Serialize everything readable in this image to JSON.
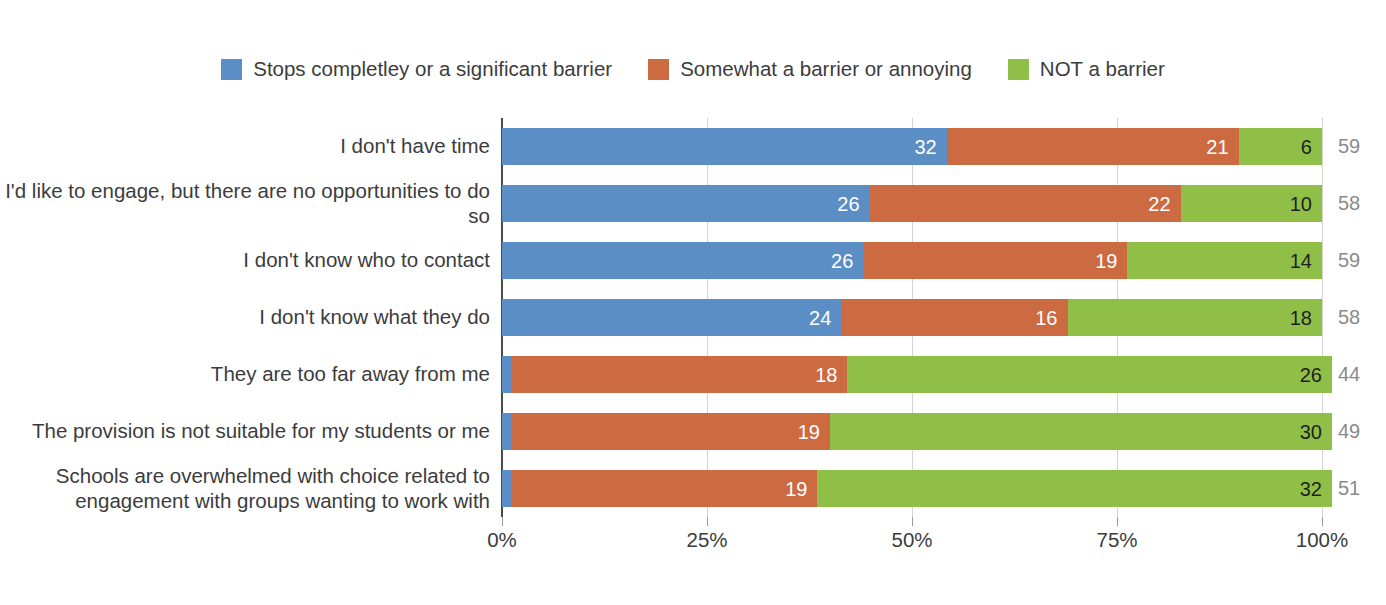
{
  "chart_data": {
    "type": "bar",
    "orientation": "horizontal",
    "stacked": true,
    "normalized": "100%",
    "title": "",
    "xlabel": "",
    "ylabel": "",
    "xlim": [
      0,
      100
    ],
    "grid": true,
    "legend_position": "top-center",
    "xtick_labels": [
      "0%",
      "25%",
      "50%",
      "75%",
      "100%"
    ],
    "xtick_values": [
      0,
      25,
      50,
      75,
      100
    ],
    "categories": [
      "I don't have time",
      "I'd like to engage, but there are no opportunities to do so",
      "I don't know who to contact",
      "I don't know what they do",
      "They are too far away from me",
      "The provision is not suitable for my students or me",
      "Schools are overwhelmed with choice related to engagement with groups wanting to work with"
    ],
    "series": [
      {
        "name": "Stops completley or a significant barrier",
        "color": "#5b8ec4",
        "values": [
          32,
          26,
          26,
          24,
          0,
          0,
          0
        ]
      },
      {
        "name": "Somewhat a barrier or annoying",
        "color": "#cc6a41",
        "values": [
          21,
          22,
          19,
          18,
          18,
          19,
          19
        ]
      },
      {
        "name": "NOT a barrier",
        "color": "#8fbf47",
        "values": [
          6,
          10,
          14,
          16,
          26,
          30,
          32
        ]
      }
    ],
    "row_totals": [
      59,
      58,
      59,
      58,
      44,
      49,
      51
    ]
  },
  "legend": {
    "entries": [
      {
        "label": "Stops completley or a significant barrier",
        "color": "#5b8ec4"
      },
      {
        "label": "Somewhat a barrier or annoying",
        "color": "#cc6a41"
      },
      {
        "label": "NOT a barrier",
        "color": "#8fbf47"
      }
    ]
  },
  "axis": {
    "ticks": [
      {
        "label": "0%",
        "value": 0
      },
      {
        "label": "25%",
        "value": 25
      },
      {
        "label": "50%",
        "value": 50
      },
      {
        "label": "75%",
        "value": 75
      },
      {
        "label": "100%",
        "value": 100
      }
    ]
  },
  "rows": [
    {
      "category": "I don't have time",
      "segments": [
        {
          "series": "Stops completley or a significant barrier",
          "value": 32,
          "label": "32"
        },
        {
          "series": "Somewhat a barrier or annoying",
          "value": 21,
          "label": "21"
        },
        {
          "series": "NOT a barrier",
          "value": 6,
          "label": "6"
        }
      ],
      "total": 59,
      "total_label": "59"
    },
    {
      "category": "I'd like to engage, but there are no opportunities to do so",
      "segments": [
        {
          "series": "Stops completley or a significant barrier",
          "value": 26,
          "label": "26"
        },
        {
          "series": "Somewhat a barrier or annoying",
          "value": 22,
          "label": "22"
        },
        {
          "series": "NOT a barrier",
          "value": 10,
          "label": "10"
        }
      ],
      "total": 58,
      "total_label": "58"
    },
    {
      "category": "I don't know who to contact",
      "segments": [
        {
          "series": "Stops completley or a significant barrier",
          "value": 26,
          "label": "26"
        },
        {
          "series": "Somewhat a barrier or annoying",
          "value": 19,
          "label": "19"
        },
        {
          "series": "NOT a barrier",
          "value": 14,
          "label": "14"
        }
      ],
      "total": 59,
      "total_label": "59"
    },
    {
      "category": "I don't know what they do",
      "segments": [
        {
          "series": "Stops completley or a significant barrier",
          "value": 24,
          "label": "24"
        },
        {
          "series": "Somewhat a barrier or annoying",
          "value": 16,
          "label": "16"
        },
        {
          "series": "NOT a barrier",
          "value": 18,
          "label": "18"
        }
      ],
      "total": 58,
      "total_label": "58"
    },
    {
      "category": "They are too far away from me",
      "segments": [
        {
          "series": "Stops completley or a significant barrier",
          "value": 0,
          "label": "0"
        },
        {
          "series": "Somewhat a barrier or annoying",
          "value": 18,
          "label": "18"
        },
        {
          "series": "NOT a barrier",
          "value": 26,
          "label": "26"
        }
      ],
      "total": 44,
      "total_label": "44"
    },
    {
      "category": "The provision is not suitable for my students or me",
      "segments": [
        {
          "series": "Stops completley or a significant barrier",
          "value": 0,
          "label": "0"
        },
        {
          "series": "Somewhat a barrier or annoying",
          "value": 19,
          "label": "19"
        },
        {
          "series": "NOT a barrier",
          "value": 30,
          "label": "30"
        }
      ],
      "total": 49,
      "total_label": "49"
    },
    {
      "category": "Schools are overwhelmed with choice related to engagement with groups wanting to work with",
      "segments": [
        {
          "series": "Stops completley or a significant barrier",
          "value": 0,
          "label": "0"
        },
        {
          "series": "Somewhat a barrier or annoying",
          "value": 19,
          "label": "19"
        },
        {
          "series": "NOT a barrier",
          "value": 32,
          "label": "32"
        }
      ],
      "total": 51,
      "total_label": "51"
    }
  ]
}
